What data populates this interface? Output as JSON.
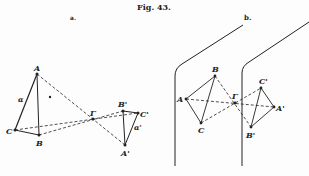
{
  "figure": {
    "title": "Fig. 43.",
    "panels": [
      {
        "label": "a.",
        "points": {
          "A": "A",
          "B": "B",
          "C": "C",
          "Gamma": "Γ",
          "A_prime": "A'",
          "B_prime": "B'",
          "C_prime": "C'"
        },
        "edge_labels": {
          "alpha": "α",
          "alpha_prime": "α'"
        }
      },
      {
        "label": "b.",
        "points": {
          "A": "A",
          "B": "B",
          "C": "C",
          "Gamma": "Γ",
          "A_prime": "A'",
          "B_prime": "B'",
          "C_prime": "C'"
        }
      }
    ],
    "colors": {
      "ink": "#222222",
      "background": "#fdfdfd"
    }
  }
}
